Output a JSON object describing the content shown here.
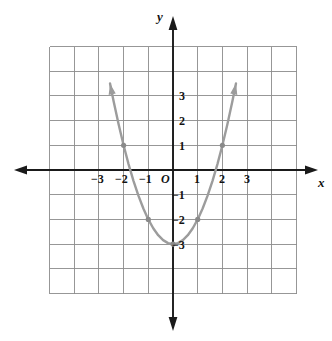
{
  "figure": {
    "kind": "coordinate-plane-graph",
    "background_color": "#ffffff",
    "grid_color": "#8c8c8c",
    "axis_color": "#1a1a1a",
    "curve_color": "#9c9c9c",
    "label_color": "#121212",
    "axes": {
      "x_label": "x",
      "y_label": "y",
      "origin_label": "O",
      "x_tick_labels": [
        "−3",
        "−2",
        "−1",
        "1",
        "2",
        "3"
      ],
      "y_tick_labels_positive": [
        "3",
        "2",
        "1"
      ],
      "y_tick_labels_negative": [
        "−1",
        "−2",
        "−3"
      ],
      "x_range": [
        -5,
        5
      ],
      "y_range": [
        -5,
        5
      ],
      "grid_on": true,
      "grid_step": 1,
      "x_arrows": [
        "left",
        "right"
      ],
      "y_arrows": [
        "up",
        "down"
      ]
    }
  },
  "chart_data": {
    "type": "line",
    "title": "",
    "xlabel": "x",
    "ylabel": "y",
    "xlim": [
      -5,
      5
    ],
    "ylim": [
      -5,
      5
    ],
    "grid": true,
    "legend": "none",
    "series": [
      {
        "name": "y = x² − 3",
        "equation": "y = x^2 - 3",
        "color": "#9c9c9c",
        "arrow_ends": [
          "both"
        ],
        "x": [
          -2.55,
          -2.4,
          -2.2,
          -2.0,
          -1.8,
          -1.6,
          -1.4,
          -1.2,
          -1.0,
          -0.8,
          -0.6,
          -0.4,
          -0.2,
          0.0,
          0.2,
          0.4,
          0.6,
          0.8,
          1.0,
          1.2,
          1.4,
          1.6,
          1.8,
          2.0,
          2.2,
          2.4,
          2.55
        ],
        "y": [
          3.5,
          2.76,
          1.84,
          1.0,
          0.24,
          -0.44,
          -1.04,
          -1.56,
          -2.0,
          -2.36,
          -2.64,
          -2.84,
          -2.96,
          -3.0,
          -2.96,
          -2.84,
          -2.64,
          -2.36,
          -2.0,
          -1.56,
          -1.04,
          -0.44,
          0.24,
          1.0,
          1.84,
          2.76,
          3.5
        ]
      }
    ],
    "marked_points": [
      {
        "x": -2,
        "y": 1,
        "label": "(−2, 1)"
      },
      {
        "x": -1,
        "y": -2,
        "label": "(−1, −2)"
      },
      {
        "x": 0,
        "y": -3,
        "label": "(0, −3)"
      },
      {
        "x": 1,
        "y": -2,
        "label": "(1, −2)"
      },
      {
        "x": 2,
        "y": 1,
        "label": "(2, 1)"
      }
    ],
    "x_ticks": [
      -3,
      -2,
      -1,
      1,
      2,
      3
    ],
    "y_ticks": [
      3,
      2,
      1,
      -1,
      -2,
      -3
    ],
    "x_tick_labels": [
      "−3",
      "−2",
      "−1",
      "1",
      "2",
      "3"
    ],
    "y_tick_labels": [
      "3",
      "2",
      "1",
      "−1",
      "−2",
      "−3"
    ]
  },
  "labels": {
    "x_axis": "x",
    "y_axis": "y",
    "origin": "O",
    "xm3": "−3",
    "xm2": "−2",
    "xm1": "−1",
    "xp1": "1",
    "xp2": "2",
    "xp3": "3",
    "yp3": "3",
    "yp2": "2",
    "yp1": "1",
    "ym1": "−1",
    "ym2": "−2",
    "ym3": "−3"
  }
}
